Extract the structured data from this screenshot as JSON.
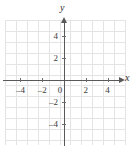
{
  "figure": {
    "kind": "cartesian-coordinate-plane",
    "background_color": "#ffffff",
    "grid_color": "#e4e4e4",
    "axis_color": "#595959",
    "label_color": "#3d3d3d"
  },
  "axes": {
    "x_name": "x",
    "y_name": "y",
    "x_arrow": "arrow-right",
    "y_arrow": "arrow-up"
  },
  "chart_data": {
    "type": "scatter",
    "title": "",
    "subtitle": "",
    "xlabel": "x",
    "ylabel": "y",
    "xlim": [
      -5.5,
      5.5
    ],
    "ylim": [
      -5.5,
      5.5
    ],
    "grid": true,
    "grid_step": 1,
    "legend": "none",
    "origin_label": "0",
    "x_ticks": [
      -4,
      -2,
      0,
      2,
      4
    ],
    "x_ticklabels": [
      "–4",
      "–2",
      "0",
      "2",
      "4"
    ],
    "y_ticks": [
      4,
      2,
      -2,
      -4
    ],
    "y_ticklabels": [
      "4",
      "2",
      "–2",
      "–4"
    ],
    "series": [
      {
        "name": "",
        "x": [],
        "y": []
      }
    ],
    "annotations": []
  },
  "geometry": {
    "grid": {
      "left": 5,
      "top": 20,
      "width": 120,
      "height": 125,
      "cols": 11,
      "rows": 11,
      "cell": 10.9
    },
    "origin": {
      "x": 64,
      "y": 80
    }
  }
}
